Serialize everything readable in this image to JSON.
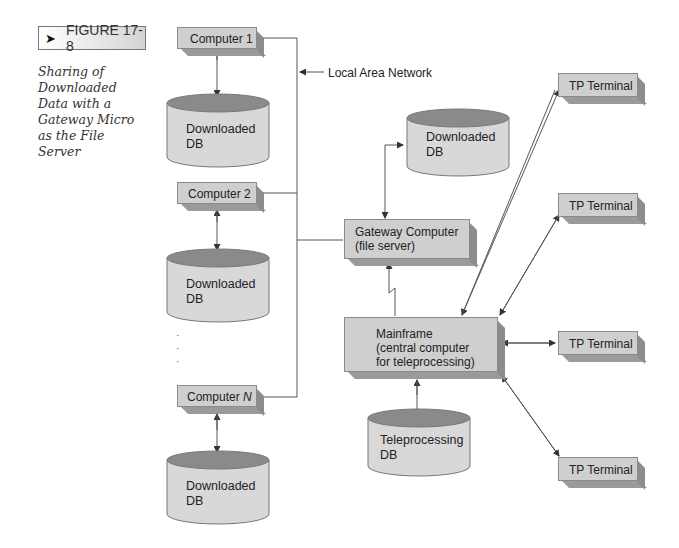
{
  "figure": {
    "label": "FIGURE 17-8",
    "caption": "Sharing of Downloaded Data with a Gateway Micro as the File Server"
  },
  "network": {
    "lan_label": "Local Area Network"
  },
  "nodes": {
    "computer1": "Computer 1",
    "computer2": "Computer 2",
    "computerN_prefix": "Computer ",
    "computerN_var": "N",
    "gateway_line1": "Gateway Computer",
    "gateway_line2": "(file server)",
    "mainframe_line1": "Mainframe",
    "mainframe_line2": "(central computer",
    "mainframe_line3": "for teleprocessing)",
    "tp_terminals": [
      "TP Terminal",
      "TP Terminal",
      "TP Terminal",
      "TP Terminal"
    ]
  },
  "databases": {
    "db1": [
      "Downloaded",
      "DB"
    ],
    "db2": [
      "Downloaded",
      "DB"
    ],
    "dbN": [
      "Downloaded",
      "DB"
    ],
    "gateway_db": [
      "Downloaded",
      "DB"
    ],
    "tp_db": [
      "Teleprocessing",
      "DB"
    ]
  },
  "ellipsis": [
    "·",
    "·",
    "·"
  ],
  "colors": {
    "box_face": "#cfcfcf",
    "box_shadow": "#8c8c8c",
    "db_top": "#8a8a8a",
    "db_body": "#d8d8d8",
    "line": "#555555"
  }
}
